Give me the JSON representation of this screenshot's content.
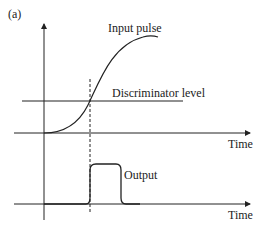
{
  "panel_label": "(a)",
  "labels": {
    "input_pulse": "Input pulse",
    "discriminator_level": "Discriminator level",
    "time_upper": "Time",
    "output": "Output",
    "time_lower": "Time"
  },
  "colors": {
    "stroke": "#222222",
    "background": "#ffffff"
  }
}
